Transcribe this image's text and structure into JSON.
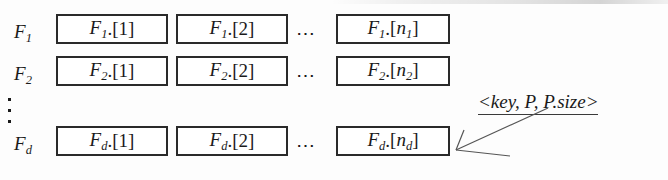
{
  "figure": {
    "background_color": "#fdfdfd",
    "ink_color": "#1a1a1a",
    "rows": [
      {
        "label_base": "F",
        "label_sub": "1",
        "cells": [
          {
            "base": "F",
            "sub": "1",
            "index": "[1]",
            "index_var": "",
            "index_var_sub": ""
          },
          {
            "base": "F",
            "sub": "1",
            "index": "[2]",
            "index_var": "",
            "index_var_sub": ""
          },
          {
            "base": "F",
            "sub": "1",
            "index": "",
            "index_var": "n",
            "index_var_sub": "1"
          }
        ],
        "ellipsis": "⋯"
      },
      {
        "label_base": "F",
        "label_sub": "2",
        "cells": [
          {
            "base": "F",
            "sub": "2",
            "index": "[1]",
            "index_var": "",
            "index_var_sub": ""
          },
          {
            "base": "F",
            "sub": "2",
            "index": "[2]",
            "index_var": "",
            "index_var_sub": ""
          },
          {
            "base": "F",
            "sub": "2",
            "index": "",
            "index_var": "n",
            "index_var_sub": "2"
          }
        ],
        "ellipsis": "⋯"
      },
      {
        "label_base": "F",
        "label_sub": "d",
        "cells": [
          {
            "base": "F",
            "sub": "d",
            "index": "[1]",
            "index_var": "",
            "index_var_sub": ""
          },
          {
            "base": "F",
            "sub": "d",
            "index": "[2]",
            "index_var": "",
            "index_var_sub": ""
          },
          {
            "base": "F",
            "sub": "d",
            "index": "",
            "index_var": "n",
            "index_var_sub": "d"
          }
        ],
        "ellipsis": "⋯"
      }
    ],
    "vertical_ellipsis": "⋮",
    "separator_dot": ".",
    "open_bracket": "[",
    "close_bracket": "]",
    "annotation": {
      "text": "<key, P, P.size>",
      "points_to": "row-3-last-cell"
    }
  }
}
